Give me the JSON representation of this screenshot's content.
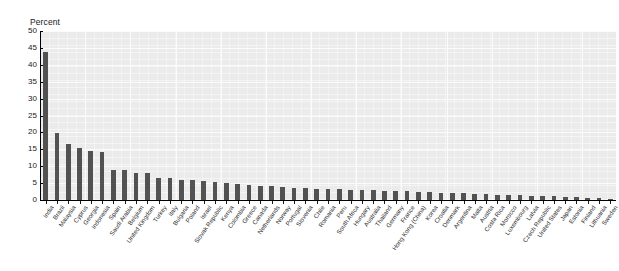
{
  "chart_data": {
    "type": "bar",
    "title": "",
    "subtitle": "",
    "xlabel": "",
    "ylabel": "Percent",
    "ylim": [
      0,
      50
    ],
    "ytick_labels": [
      "0",
      "5",
      "10",
      "15",
      "20",
      "25",
      "30",
      "35",
      "40",
      "45",
      "50"
    ],
    "ytick_values": [
      0,
      5,
      10,
      15,
      20,
      25,
      30,
      35,
      40,
      45,
      50
    ],
    "grid": true,
    "legend": null,
    "bar_color": "#525252",
    "plot_background": "#ebebeb",
    "categories": [
      "India",
      "Brazil",
      "Malaysia",
      "Cyprus",
      "Georgia",
      "Indonesia",
      "Spain",
      "Saudi Arabia",
      "Belgium",
      "United Kingdom",
      "Turkey",
      "Italy",
      "Bulgaria",
      "Poland",
      "Israel",
      "Slovak Republic",
      "Kenya",
      "Colombia",
      "Greece",
      "Canada",
      "Netherlands",
      "Norway",
      "Portugal",
      "Slovenia",
      "Chile",
      "Romania",
      "Peru",
      "South Africa",
      "Hungary",
      "Australia",
      "Thailand",
      "Germany",
      "France",
      "Hong Kong (China)",
      "Korea",
      "Croatia",
      "Denmark",
      "Argentina",
      "Malta",
      "Austria",
      "Costa Rica",
      "Morocco",
      "Luxembourg",
      "Latvia",
      "Czech Republic",
      "United States",
      "Japan",
      "Estonia",
      "Finland",
      "Lithuania",
      "Sweden"
    ],
    "values": [
      43.9,
      19.7,
      16.5,
      15.3,
      14.4,
      14.1,
      9.0,
      8.8,
      8.1,
      7.9,
      6.6,
      6.6,
      5.9,
      5.8,
      5.6,
      5.4,
      5.1,
      4.6,
      4.3,
      4.2,
      4.0,
      3.9,
      3.7,
      3.5,
      3.4,
      3.3,
      3.2,
      3.1,
      3.0,
      2.9,
      2.8,
      2.7,
      2.6,
      2.5,
      2.4,
      2.2,
      2.1,
      2.0,
      1.9,
      1.8,
      1.6,
      1.5,
      1.4,
      1.3,
      1.2,
      1.1,
      0.9,
      0.8,
      0.7,
      0.5,
      0.3
    ]
  }
}
